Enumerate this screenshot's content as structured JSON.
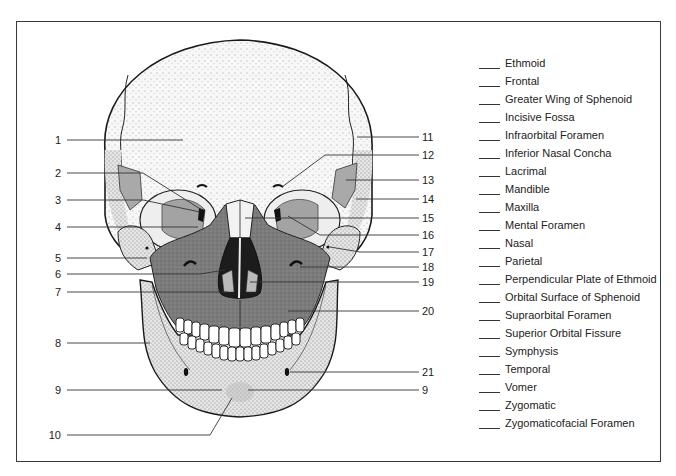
{
  "diagram": {
    "left_labels": [
      {
        "number": "1",
        "y": 140
      },
      {
        "number": "2",
        "y": 173
      },
      {
        "number": "3",
        "y": 200
      },
      {
        "number": "4",
        "y": 227
      },
      {
        "number": "5",
        "y": 258
      },
      {
        "number": "6",
        "y": 274
      },
      {
        "number": "7",
        "y": 292
      },
      {
        "number": "8",
        "y": 343
      },
      {
        "number": "9",
        "y": 390
      },
      {
        "number": "10",
        "y": 435
      }
    ],
    "right_labels": [
      {
        "number": "11",
        "y": 137
      },
      {
        "number": "12",
        "y": 155
      },
      {
        "number": "13",
        "y": 180
      },
      {
        "number": "14",
        "y": 199
      },
      {
        "number": "15",
        "y": 218
      },
      {
        "number": "16",
        "y": 235
      },
      {
        "number": "17",
        "y": 252
      },
      {
        "number": "18",
        "y": 267
      },
      {
        "number": "19",
        "y": 282
      },
      {
        "number": "20",
        "y": 311
      },
      {
        "number": "21",
        "y": 372
      },
      {
        "number": "9",
        "y": 390
      }
    ],
    "legend": [
      {
        "blank": "____",
        "label": "Ethmoid"
      },
      {
        "blank": "____",
        "label": "Frontal"
      },
      {
        "blank": "____",
        "label": "Greater Wing of Sphenoid"
      },
      {
        "blank": "____",
        "label": "Incisive Fossa"
      },
      {
        "blank": "____",
        "label": "Infraorbital Foramen"
      },
      {
        "blank": "____",
        "label": "Inferior Nasal Concha"
      },
      {
        "blank": "____",
        "label": "Lacrimal"
      },
      {
        "blank": "____",
        "label": "Mandible"
      },
      {
        "blank": "____",
        "label": "Maxilla"
      },
      {
        "blank": "____",
        "label": "Mental Foramen"
      },
      {
        "blank": "____",
        "label": "Nasal"
      },
      {
        "blank": "____",
        "label": "Parietal"
      },
      {
        "blank": "____",
        "label": "Perpendicular Plate of Ethmoid"
      },
      {
        "blank": "____",
        "label": "Orbital Surface of Sphenoid"
      },
      {
        "blank": "____",
        "label": "Supraorbital Foramen"
      },
      {
        "blank": "____",
        "label": "Superior Orbital Fissure"
      },
      {
        "blank": "____",
        "label": "Symphysis"
      },
      {
        "blank": "____",
        "label": "Temporal"
      },
      {
        "blank": "____",
        "label": "Vomer"
      },
      {
        "blank": "____",
        "label": "Zygomatic"
      },
      {
        "blank": "____",
        "label": "Zygomaticofacial Foramen"
      }
    ],
    "colors": {
      "bone_light": "#f4f4f4",
      "maxilla_dark": "#7a7a7a",
      "sphenoid_mid": "#a8a8a8",
      "outline": "#1a1a1a",
      "leader_line": "#333333"
    }
  }
}
